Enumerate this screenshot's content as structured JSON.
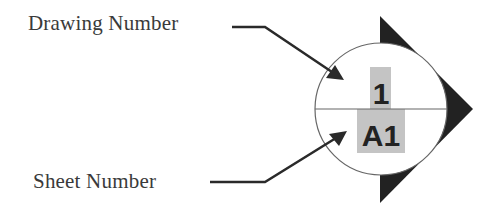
{
  "labels": {
    "drawing_number": "Drawing Number",
    "sheet_number": "Sheet Number"
  },
  "symbol": {
    "type": "section-marker",
    "drawing_number_value": "1",
    "sheet_number_value": "A1",
    "colors": {
      "triangle": "#222222",
      "circle_stroke": "#666666",
      "divider": "#666666",
      "highlight": "#c4c4c4",
      "symbol_text": "#222222",
      "leader": "#2a2a2a",
      "label_text": "#3a3a3a"
    }
  }
}
